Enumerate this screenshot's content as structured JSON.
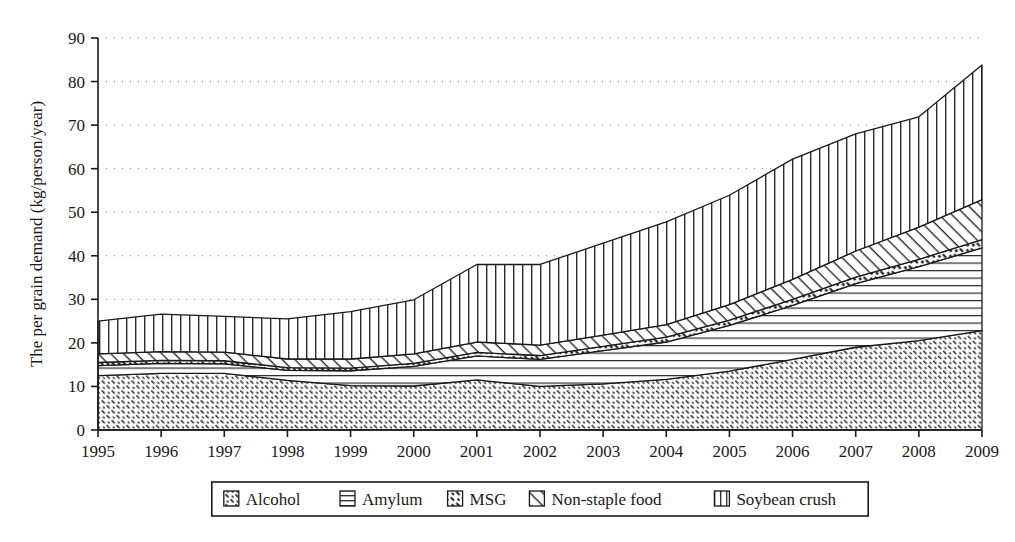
{
  "chart_data": {
    "type": "area",
    "stacked": true,
    "title": "",
    "xlabel": "",
    "ylabel": "The per grain demand (kg/person/year)",
    "categories": [
      "1995",
      "1996",
      "1997",
      "1998",
      "1999",
      "2000",
      "2001",
      "2002",
      "2003",
      "2004",
      "2005",
      "2006",
      "2007",
      "2008",
      "2009"
    ],
    "x": [
      1995,
      1996,
      1997,
      1998,
      1999,
      2000,
      2001,
      2002,
      2003,
      2004,
      2005,
      2006,
      2007,
      2008,
      2009
    ],
    "ylim": [
      0,
      90
    ],
    "xlim": [
      1995,
      2009
    ],
    "yticks": [
      0,
      10,
      20,
      30,
      40,
      50,
      60,
      70,
      80,
      90
    ],
    "grid": "horizontal-dotted",
    "legend_position": "bottom",
    "series": [
      {
        "name": "Alcohol",
        "pattern": "dense-diagonal-dots",
        "values": [
          12.5,
          13.0,
          13.0,
          11.4,
          10.2,
          10.1,
          11.5,
          10.0,
          10.6,
          11.6,
          13.5,
          16.2,
          19.0,
          20.5,
          22.8
        ]
      },
      {
        "name": "Amylum",
        "pattern": "horizontal-lines",
        "values": [
          2.3,
          2.3,
          2.2,
          2.3,
          3.4,
          4.5,
          5.5,
          6.2,
          7.6,
          8.6,
          10.5,
          12.4,
          14.6,
          17.0,
          19.0
        ]
      },
      {
        "name": "MSG",
        "pattern": "dotted-band",
        "values": [
          0.7,
          0.7,
          0.7,
          0.6,
          0.6,
          0.7,
          0.8,
          0.9,
          1.0,
          1.1,
          1.2,
          1.4,
          1.5,
          1.7,
          1.9
        ]
      },
      {
        "name": "Non-staple food",
        "pattern": "diagonal-hatch",
        "values": [
          2.0,
          2.0,
          2.0,
          2.0,
          2.1,
          2.2,
          2.4,
          2.4,
          2.6,
          2.9,
          3.6,
          4.6,
          6.0,
          7.4,
          9.2
        ]
      },
      {
        "name": "Soybean crush",
        "pattern": "vertical-lines",
        "values": [
          7.5,
          8.6,
          8.2,
          9.2,
          10.9,
          12.4,
          17.8,
          18.5,
          21.1,
          23.6,
          25.1,
          27.6,
          26.9,
          25.3,
          30.9
        ]
      }
    ],
    "totals": [
      25.0,
      26.6,
      26.1,
      25.5,
      27.2,
      29.9,
      38.0,
      38.0,
      42.9,
      47.8,
      53.9,
      62.2,
      68.0,
      71.9,
      83.8
    ],
    "legend": [
      "Alcohol",
      "Amylum",
      "MSG",
      "Non-staple food",
      "Soybean crush"
    ]
  },
  "axis": {
    "y_title": "The per grain demand (kg/person/year)",
    "y_ticks": [
      "0",
      "10",
      "20",
      "30",
      "40",
      "50",
      "60",
      "70",
      "80",
      "90"
    ],
    "x_ticks": [
      "1995",
      "1996",
      "1997",
      "1998",
      "1999",
      "2000",
      "2001",
      "2002",
      "2003",
      "2004",
      "2005",
      "2006",
      "2007",
      "2008",
      "2009"
    ]
  },
  "legend": {
    "items": [
      {
        "label": "Alcohol",
        "swatch": "swatch-dense-diagonal-dots"
      },
      {
        "label": "Amylum",
        "swatch": "swatch-horizontal-lines"
      },
      {
        "label": "MSG",
        "swatch": "swatch-dotted-band"
      },
      {
        "label": "Non-staple food",
        "swatch": "swatch-diagonal-hatch"
      },
      {
        "label": "Soybean crush",
        "swatch": "swatch-vertical-lines"
      }
    ]
  }
}
